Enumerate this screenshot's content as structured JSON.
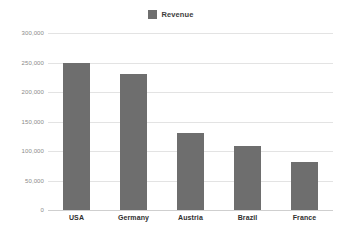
{
  "chart_data": {
    "type": "bar",
    "title": "",
    "subtitle": "",
    "xlabel": "",
    "ylabel": "",
    "categories": [
      "USA",
      "Germany",
      "Austria",
      "Brazil",
      "France"
    ],
    "series": [
      {
        "name": "Revenue",
        "color": "#6e6e6e",
        "values": [
          250000,
          230000,
          130000,
          108000,
          82000
        ]
      }
    ],
    "ylim": [
      0,
      300000
    ],
    "y_ticks": [
      0,
      50000,
      100000,
      150000,
      200000,
      250000,
      300000
    ],
    "y_tick_labels": [
      "0",
      "50,000",
      "100,000",
      "150,000",
      "200,000",
      "250,000",
      "300,000"
    ],
    "grid": true,
    "legend": {
      "position": "top-center",
      "entries": [
        {
          "label": "Revenue",
          "color": "#6e6e6e",
          "swatch": "square-swatch-icon"
        }
      ]
    },
    "background_color": "#ffffff",
    "gridline_color": "#e3e3e3",
    "axis_color": "#cfcfcf"
  }
}
